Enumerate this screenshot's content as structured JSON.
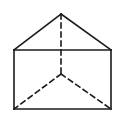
{
  "diagram": {
    "type": "geometric-solid",
    "background": "#ffffff",
    "stroke_color": "#1a1a1a",
    "stroke_width": 1.6,
    "dash_pattern": "5 4",
    "vertices": {
      "apex_top": [
        61,
        14
      ],
      "front_top_left": [
        14,
        50
      ],
      "front_top_right": [
        111,
        50
      ],
      "front_bottom_left": [
        14,
        109
      ],
      "front_bottom_right": [
        111,
        109
      ],
      "hidden_back": [
        61,
        74
      ]
    },
    "solid_edges": [
      {
        "from": "apex_top",
        "to": "front_top_left"
      },
      {
        "from": "apex_top",
        "to": "front_top_right"
      },
      {
        "from": "front_top_left",
        "to": "front_top_right"
      },
      {
        "from": "front_top_left",
        "to": "front_bottom_left"
      },
      {
        "from": "front_top_right",
        "to": "front_bottom_right"
      },
      {
        "from": "front_bottom_left",
        "to": "front_bottom_right"
      }
    ],
    "hidden_edges": [
      {
        "from": "apex_top",
        "to": "hidden_back"
      },
      {
        "from": "hidden_back",
        "to": "front_bottom_left"
      },
      {
        "from": "hidden_back",
        "to": "front_bottom_right"
      }
    ]
  }
}
